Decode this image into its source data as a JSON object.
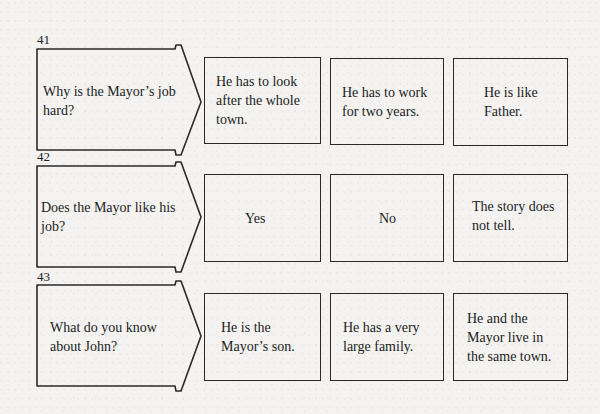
{
  "questions": [
    {
      "number": "41",
      "question": "Why is the Mayor’s job hard?",
      "options": [
        "He has to look after the whole town.",
        "He has to work for two years.",
        "He is like Father."
      ]
    },
    {
      "number": "42",
      "question": "Does the Mayor like his job?",
      "options": [
        "Yes",
        "No",
        "The story does not tell."
      ]
    },
    {
      "number": "43",
      "question": "What do you know about John?",
      "options": [
        "He is the Mayor’s son.",
        "He has a very large family.",
        "He and the Mayor live in the same town."
      ]
    }
  ],
  "colors": {
    "line": "#2a2a2a",
    "background": "#f4f3f1",
    "text": "#222222"
  }
}
